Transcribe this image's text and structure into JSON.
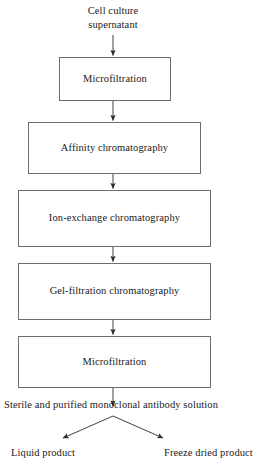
{
  "diagram": {
    "orientation": "top-to-bottom",
    "stroke_color": "#6e6e6e",
    "text_color": "#1a1a1a",
    "background_color": "#ffffff"
  },
  "nodes": {
    "input_label": "Cell culture\nsupernatant",
    "step_1": "Microfiltration",
    "step_2": "Affinity chromatography",
    "step_3": "Ion-exchange chromatography",
    "step_4": "Gel-filtration chromatography",
    "step_5": "Microfiltration",
    "output_label": "Sterile and purified monoclonal antibody solution",
    "branch_left": "Liquid product",
    "branch_right": "Freeze dried product"
  },
  "edges": [
    {
      "name": "input-to-step1",
      "from": "input_label",
      "to": "step_1",
      "arrowhead": true
    },
    {
      "name": "step1-to-step2",
      "from": "step_1",
      "to": "step_2",
      "arrowhead": true
    },
    {
      "name": "step2-to-step3",
      "from": "step_2",
      "to": "step_3",
      "arrowhead": true
    },
    {
      "name": "step3-to-step4",
      "from": "step_3",
      "to": "step_4",
      "arrowhead": true
    },
    {
      "name": "step4-to-step5",
      "from": "step_4",
      "to": "step_5",
      "arrowhead": true
    },
    {
      "name": "step5-to-output",
      "from": "step_5",
      "to": "output_label",
      "arrowhead": true
    },
    {
      "name": "output-to-liquid-product",
      "from": "output_label",
      "to": "branch_left",
      "arrowhead": true
    },
    {
      "name": "output-to-freeze-dried-product",
      "from": "output_label",
      "to": "branch_right",
      "arrowhead": true
    }
  ]
}
